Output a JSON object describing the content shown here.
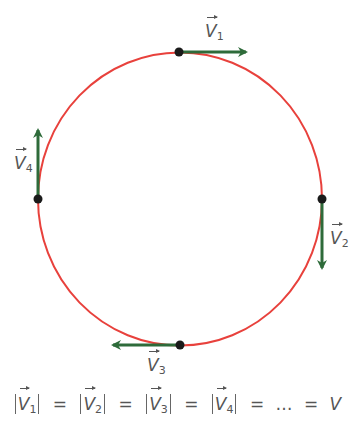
{
  "diagram": {
    "colors": {
      "circle": "#e8413c",
      "vector": "#2e6b3a",
      "point": "#1a1a1a",
      "text": "#555555"
    },
    "circle": {
      "cx": 180,
      "cy": 199,
      "rx": 142,
      "ry": 146.5
    },
    "vectors": [
      {
        "name": "V",
        "index": "1",
        "position": "top",
        "direction": "right"
      },
      {
        "name": "V",
        "index": "2",
        "position": "right",
        "direction": "down"
      },
      {
        "name": "V",
        "index": "3",
        "position": "bottom",
        "direction": "left"
      },
      {
        "name": "V",
        "index": "4",
        "position": "left",
        "direction": "up"
      }
    ]
  },
  "equation": {
    "terms": [
      {
        "name": "V",
        "index": "1"
      },
      {
        "name": "V",
        "index": "2"
      },
      {
        "name": "V",
        "index": "3"
      },
      {
        "name": "V",
        "index": "4"
      }
    ],
    "equals": "=",
    "ellipsis": "…",
    "result": "V"
  }
}
